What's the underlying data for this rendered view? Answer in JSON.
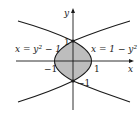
{
  "figure": {
    "axes": {
      "x_label": "x",
      "y_label": "y"
    },
    "curves": [
      {
        "label": "x = y² − 1",
        "equation": "x = y^2 - 1"
      },
      {
        "label": "x = 1 − y²",
        "equation": "x = 1 - y^2"
      }
    ],
    "ticks": {
      "y_top": "1",
      "y_bottom": "−1",
      "x_left": "−1",
      "x_right": "1"
    },
    "labels": {
      "left_curve": "x = y² − 1",
      "right_curve": "x = 1 − y²"
    },
    "colors": {
      "shade": "#bdbdbd",
      "line": "#1a1a1a"
    }
  }
}
